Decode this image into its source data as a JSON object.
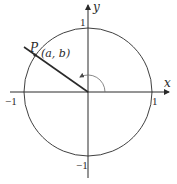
{
  "diagram": {
    "type": "unit-circle",
    "colors": {
      "stroke": "#2a2a2a",
      "arc": "#6a6a6a",
      "background": "#ffffff"
    },
    "axes": {
      "x_label": "x",
      "y_label": "y"
    },
    "ticks": {
      "x_pos": "1",
      "x_neg": "−1",
      "y_pos": "1",
      "y_neg": "−1"
    },
    "point": {
      "name": "P",
      "coords": "(a, b)"
    },
    "angle_indicator": "arc-with-arrow"
  }
}
